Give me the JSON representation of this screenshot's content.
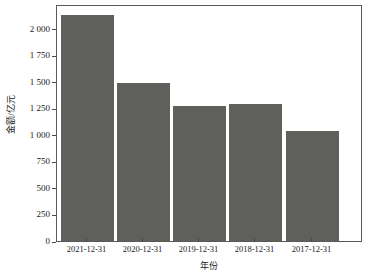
{
  "chart_data": {
    "type": "bar",
    "title": "",
    "subtitle": "",
    "xlabel": "年份",
    "ylabel": "金额/亿元",
    "categories": [
      "2021-12-31",
      "2020-12-31",
      "2019-12-31",
      "2018-12-31",
      "2017-12-31"
    ],
    "values": [
      2160,
      1510,
      1293,
      1311,
      1057
    ],
    "series": [
      {
        "name": "金额/亿元",
        "values": [
          2160,
          1510,
          1293,
          1311,
          1057
        ]
      }
    ],
    "ylim": [
      0,
      2250
    ],
    "yticks": [
      0,
      250,
      500,
      750,
      1000,
      1250,
      1500,
      1750,
      2000
    ],
    "ytick_labels": [
      "0",
      "250",
      "500",
      "750",
      "1 000",
      "1 250",
      "1 500",
      "1 750",
      "2 000"
    ],
    "grid": false,
    "legend": null,
    "legend_position": "none",
    "bar_color": "#5f5f5c",
    "frame_color": "#5a5a5a",
    "background_color": "#ffffff",
    "annotations": []
  }
}
